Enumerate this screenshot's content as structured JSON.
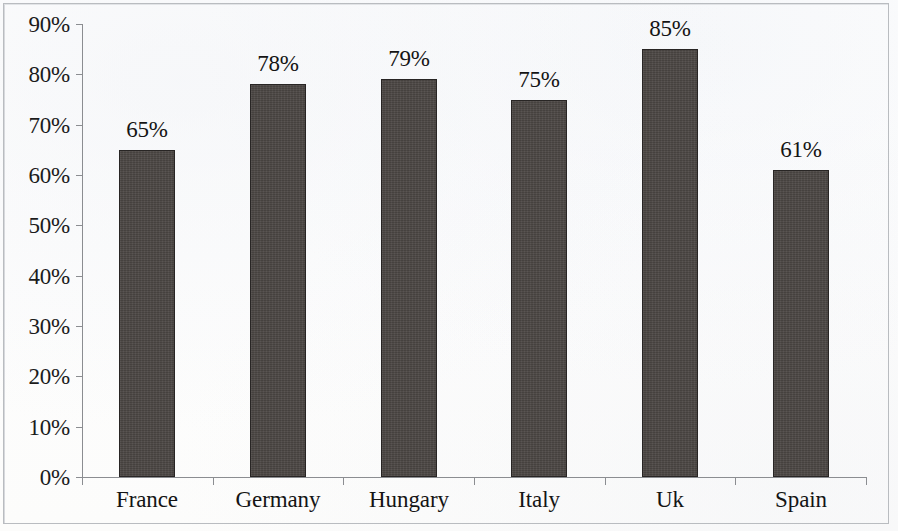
{
  "chart_data": {
    "type": "bar",
    "title": "",
    "subtitle": "",
    "xlabel": "",
    "ylabel": "",
    "categories": [
      "France",
      "Germany",
      "Hungary",
      "Italy",
      "Uk",
      "Spain"
    ],
    "values": [
      65,
      78,
      79,
      75,
      85,
      61
    ],
    "data_labels": [
      "65%",
      "78%",
      "79%",
      "75%",
      "85%",
      "61%"
    ],
    "ylim": [
      0,
      90
    ],
    "ytick_values": [
      0,
      10,
      20,
      30,
      40,
      50,
      60,
      70,
      80,
      90
    ],
    "ytick_labels": [
      "0%",
      "10%",
      "20%",
      "30%",
      "40%",
      "50%",
      "60%",
      "70%",
      "80%",
      "90%"
    ],
    "grid": false,
    "legend": null,
    "legend_position": "none",
    "series": [
      {
        "name": "",
        "values": [
          65,
          78,
          79,
          75,
          85,
          61
        ]
      }
    ],
    "colors": {
      "bar_fill": "#4c4744",
      "bar_border": "#282524",
      "axis": "#8b8d91",
      "text": "#141414",
      "background": "#fdfdfc",
      "frame": "#b9bcc0"
    }
  },
  "artifacts": {
    "bleed_through": [
      "",
      "",
      ""
    ]
  }
}
